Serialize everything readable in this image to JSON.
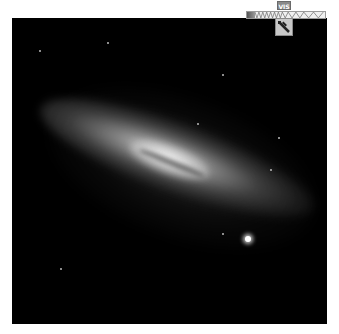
{
  "viewer": {
    "subject": "galaxy-image",
    "background_color": "#000000"
  },
  "wavelength_control": {
    "current_band_label": "VIS",
    "scale_segments": [
      "uv",
      "visible",
      "infrared"
    ],
    "handle_icon": "telescope-icon",
    "colors": {
      "bar_border": "#9a9a9a",
      "label_bg": "#8a8a8a",
      "handle_bg": "#c8c8c8"
    }
  }
}
